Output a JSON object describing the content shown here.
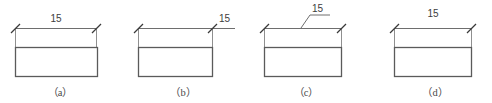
{
  "figure": {
    "background_color": "#ffffff",
    "line_color": "#5a5a5a",
    "text_color": "#3d3d3d",
    "dimension_value": "15",
    "panel_count": 4
  },
  "panels": [
    {
      "id": "a",
      "caption": "（a）",
      "dimension_label": "15",
      "label_placement": "centered-above-dimension-line",
      "has_leader": false,
      "dimension_line_overruns_right": false,
      "rect": {
        "x": 15,
        "y": 47,
        "width": 82,
        "height": 29
      },
      "dim_line": {
        "y": 28,
        "x1": 15,
        "x2": 97
      },
      "label_pos": {
        "x": 56,
        "y": 22
      }
    },
    {
      "id": "b",
      "caption": "（b）",
      "dimension_label": "15",
      "label_placement": "right-of-right-extension-line",
      "has_leader": false,
      "dimension_line_overruns_right": true,
      "rect": {
        "x": 15,
        "y": 47,
        "width": 75,
        "height": 29
      },
      "dim_line": {
        "y": 28,
        "x1": 15,
        "x2": 110
      },
      "label_pos": {
        "x": 96,
        "y": 22
      }
    },
    {
      "id": "c",
      "caption": "（c）",
      "dimension_label": "15",
      "label_placement": "on-leader-line-above",
      "has_leader": true,
      "dimension_line_overruns_right": false,
      "rect": {
        "x": 18,
        "y": 47,
        "width": 78,
        "height": 29
      },
      "dim_line": {
        "y": 28,
        "x1": 18,
        "x2": 96
      },
      "label_pos": {
        "x": 62,
        "y": 13
      },
      "leader": {
        "from_x": 55,
        "from_y": 28,
        "elbow_x": 64,
        "elbow_y": 16,
        "to_x": 82,
        "to_y": 16
      }
    },
    {
      "id": "d",
      "caption": "（d）",
      "dimension_label": "15",
      "label_placement": "high-above-dimension-line",
      "has_leader": false,
      "dimension_line_overruns_right": false,
      "rect": {
        "x": 25,
        "y": 47,
        "width": 78,
        "height": 29
      },
      "dim_line": {
        "y": 28,
        "x1": 25,
        "x2": 103
      },
      "label_pos": {
        "x": 64,
        "y": 17
      }
    }
  ],
  "captions": {
    "a": "（a）",
    "b": "（b）",
    "c": "（c）",
    "d": "（d）"
  },
  "dimension_labels": {
    "a": "15",
    "b": "15",
    "c": "15",
    "d": "15"
  }
}
